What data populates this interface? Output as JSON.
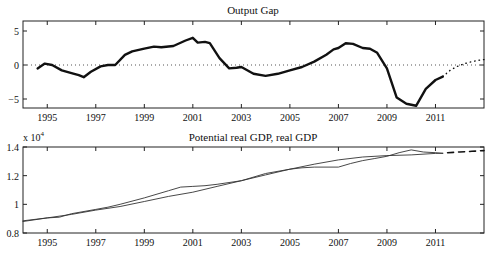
{
  "chart_data": [
    {
      "type": "line",
      "title": "Output Gap",
      "xlabel": "",
      "ylabel": "",
      "xlim": [
        1994.0,
        2013.0
      ],
      "ylim": [
        -6.5,
        6.4
      ],
      "x_ticks": [
        "1995",
        "1997",
        "1999",
        "2001",
        "2003",
        "2005",
        "2007",
        "2009",
        "2011"
      ],
      "y_ticks": [
        "5",
        "0",
        "−5"
      ],
      "grid": false,
      "legend": null,
      "reference_line": {
        "y": 0,
        "style": "dotted"
      },
      "series": [
        {
          "name": "Output gap",
          "style": "solid-thick",
          "x": [
            1994.6,
            1994.9,
            1995.2,
            1995.6,
            1996.0,
            1996.3,
            1996.5,
            1996.8,
            1997.2,
            1997.5,
            1997.8,
            1998.2,
            1998.5,
            1999.0,
            1999.4,
            1999.7,
            2000.2,
            2000.7,
            2001.0,
            2001.2,
            2001.5,
            2001.7,
            2002.1,
            2002.5,
            2002.8,
            2003.0,
            2003.5,
            2004.0,
            2004.5,
            2005.0,
            2005.5,
            2006.0,
            2006.5,
            2006.8,
            2007.0,
            2007.3,
            2007.6,
            2008.0,
            2008.3,
            2008.6,
            2009.0,
            2009.4,
            2009.8,
            2010.2,
            2010.6,
            2011.0,
            2011.3
          ],
          "values": [
            -0.5,
            0.2,
            0.0,
            -0.8,
            -1.2,
            -1.5,
            -1.8,
            -1.0,
            -0.2,
            0.0,
            0.0,
            1.5,
            2.0,
            2.4,
            2.7,
            2.6,
            2.8,
            3.6,
            4.0,
            3.3,
            3.4,
            3.2,
            1.0,
            -0.5,
            -0.4,
            -0.3,
            -1.3,
            -1.6,
            -1.3,
            -0.8,
            -0.3,
            0.5,
            1.5,
            2.3,
            2.5,
            3.2,
            3.1,
            2.5,
            2.4,
            1.8,
            -0.5,
            -4.8,
            -5.7,
            -6.0,
            -3.5,
            -2.2,
            -1.7
          ]
        },
        {
          "name": "Output gap forecast",
          "style": "dotted",
          "x": [
            2011.3,
            2011.6,
            2011.9,
            2012.2,
            2012.5,
            2012.8,
            2013.0
          ],
          "values": [
            -1.7,
            -0.8,
            -0.2,
            0.2,
            0.5,
            0.7,
            0.8
          ]
        }
      ]
    },
    {
      "type": "line",
      "title": "Potential real GDP, real GDP",
      "xlabel": "",
      "ylabel": "",
      "y_multiplier": "x 10^4",
      "xlim": [
        1994.0,
        2013.0
      ],
      "ylim": [
        0.8,
        1.4
      ],
      "x_ticks": [
        "1995",
        "1997",
        "1999",
        "2001",
        "2003",
        "2005",
        "2007",
        "2009",
        "2011"
      ],
      "y_ticks": [
        "1.4",
        "1.2",
        "1",
        "0.8"
      ],
      "grid": false,
      "legend": null,
      "series": [
        {
          "name": "Potential real GDP",
          "style": "solid-thin",
          "x": [
            1994.0,
            1995.0,
            1996.0,
            1997.0,
            1998.0,
            1999.0,
            2000.0,
            2001.0,
            2002.0,
            2003.0,
            2004.0,
            2005.0,
            2006.0,
            2007.0,
            2008.0,
            2009.0,
            2010.0,
            2011.0,
            2011.3
          ],
          "values": [
            0.885,
            0.905,
            0.93,
            0.96,
            0.985,
            1.02,
            1.055,
            1.085,
            1.125,
            1.165,
            1.205,
            1.245,
            1.28,
            1.31,
            1.33,
            1.34,
            1.345,
            1.355,
            1.357
          ]
        },
        {
          "name": "Real GDP",
          "style": "solid-thin",
          "x": [
            1994.0,
            1995.0,
            1995.5,
            1996.0,
            1997.0,
            1997.5,
            1998.0,
            1999.0,
            2000.0,
            2000.5,
            2001.0,
            2001.5,
            2002.0,
            2003.0,
            2004.0,
            2005.0,
            2005.5,
            2006.0,
            2007.0,
            2007.5,
            2008.0,
            2008.5,
            2009.0,
            2009.5,
            2010.0,
            2010.5,
            2011.0,
            2011.3
          ],
          "values": [
            0.88,
            0.905,
            0.91,
            0.935,
            0.965,
            0.98,
            1.0,
            1.045,
            1.095,
            1.12,
            1.125,
            1.13,
            1.14,
            1.165,
            1.215,
            1.245,
            1.255,
            1.26,
            1.26,
            1.285,
            1.305,
            1.32,
            1.335,
            1.36,
            1.38,
            1.365,
            1.36,
            1.355
          ]
        },
        {
          "name": "Potential real GDP forecast",
          "style": "dashed",
          "x": [
            2011.5,
            2012.0,
            2012.5,
            2013.0
          ],
          "values": [
            1.36,
            1.365,
            1.37,
            1.375
          ]
        }
      ]
    }
  ],
  "panels": {
    "top": {
      "title": "Output Gap"
    },
    "bottom": {
      "title": "Potential real GDP, real GDP",
      "multiplier_base": "x 10",
      "multiplier_exp": "4"
    }
  }
}
